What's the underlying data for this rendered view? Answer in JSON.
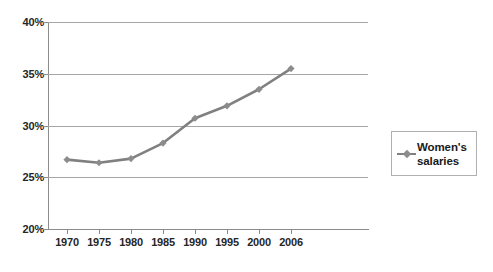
{
  "chart_data": {
    "type": "line",
    "title": "",
    "subtitle": "",
    "xlabel": "",
    "ylabel": "",
    "categories": [
      "1970",
      "1975",
      "1980",
      "1985",
      "1990",
      "1995",
      "2000",
      "2006"
    ],
    "x_tick_labels": [
      "1970",
      "1975",
      "1980",
      "1985",
      "1990",
      "1995",
      "2000",
      "2006"
    ],
    "y_tick_labels": [
      "40%",
      "35%",
      "30%",
      "25%",
      "20%"
    ],
    "y_tick_values": [
      40,
      35,
      30,
      25,
      20
    ],
    "ylim": [
      20,
      40
    ],
    "y_unit": "%",
    "grid": true,
    "grid_axis": "y",
    "legend_position": "right",
    "series": [
      {
        "name": "Women's salaries",
        "color": "#808080",
        "marker": "diamond",
        "values": [
          26.7,
          26.4,
          26.8,
          28.3,
          30.7,
          31.9,
          33.5,
          35.5
        ]
      }
    ]
  },
  "legend": {
    "entries": [
      {
        "label_line_1": "Women's",
        "label_line_2": "salaries",
        "label": "Women's salaries",
        "color": "#808080"
      }
    ]
  },
  "colors": {
    "series": "#808080",
    "gridline": "#a6a6a6",
    "axis": "#8c8c8c",
    "text": "#262626",
    "background": "#ffffff"
  }
}
